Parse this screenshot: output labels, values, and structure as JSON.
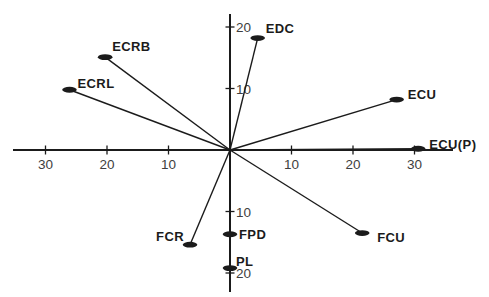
{
  "figure": {
    "width": 489,
    "height": 297,
    "background": "#ffffff",
    "line_color": "#1b1b1b",
    "tick_label_color": "#3e3e3e"
  },
  "chart_data": {
    "type": "scatter",
    "title": "",
    "xlabel": "",
    "ylabel": "",
    "xlim": [
      -35.5,
      36.5
    ],
    "ylim": [
      -23.5,
      22.5
    ],
    "grid": false,
    "legend": "none",
    "vectors_from_origin": true,
    "x_ticks": [
      -30,
      -20,
      -10,
      10,
      20,
      30
    ],
    "x_tick_labels": [
      "30",
      "20",
      "10",
      "10",
      "20",
      "30"
    ],
    "y_ticks": [
      20,
      10,
      -10,
      -20
    ],
    "y_tick_labels": [
      "20",
      "10",
      "10",
      "20"
    ],
    "series": [
      {
        "name": "ECRB",
        "x": -20.3,
        "y": 15.1
      },
      {
        "name": "ECRL",
        "x": -26.1,
        "y": 9.8
      },
      {
        "name": "EDC",
        "x": 4.5,
        "y": 18.2
      },
      {
        "name": "ECU",
        "x": 27.1,
        "y": 8.2
      },
      {
        "name": "ECU(P)",
        "x": 30.6,
        "y": 0.2
      },
      {
        "name": "FCU",
        "x": 21.5,
        "y": -13.5
      },
      {
        "name": "FCR",
        "x": -6.5,
        "y": -15.4
      },
      {
        "name": "FPD",
        "x": 0,
        "y": -13.7
      },
      {
        "name": "PL",
        "x": 0,
        "y": -19.2
      }
    ],
    "label_layout": {
      "ECRB": {
        "anchor": "start",
        "dx": 7,
        "dy": -6
      },
      "ECRL": {
        "anchor": "start",
        "dx": 8,
        "dy": -2
      },
      "EDC": {
        "anchor": "start",
        "dx": 8,
        "dy": -5
      },
      "ECU": {
        "anchor": "start",
        "dx": 11,
        "dy": -1
      },
      "ECU(P)": {
        "anchor": "start",
        "dx": 11,
        "dy": 0
      },
      "FCU": {
        "anchor": "start",
        "dx": 15,
        "dy": 9
      },
      "FCR": {
        "anchor": "end",
        "dx": -6,
        "dy": -4
      },
      "FPD": {
        "anchor": "start",
        "dx": 9,
        "dy": 5
      },
      "PL": {
        "anchor": "start",
        "dx": 6,
        "dy": -2
      }
    }
  }
}
